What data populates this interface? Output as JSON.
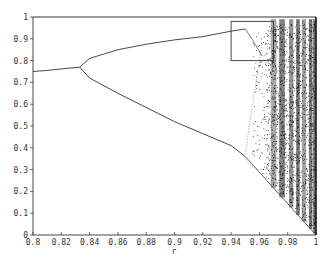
{
  "chart_data": {
    "type": "scatter",
    "title": "",
    "xlabel": "r",
    "ylabel": "",
    "xlim": [
      0.8,
      1.0
    ],
    "ylim": [
      0,
      1
    ],
    "grid": false,
    "legend": null,
    "x_ticks": [
      "0.8",
      "0.82",
      "0.84",
      "0.86",
      "0.88",
      "0.9",
      "0.92",
      "0.94",
      "0.96",
      "0.98",
      "1"
    ],
    "y_ticks": [
      "0",
      "0.1",
      "0.2",
      "0.3",
      "0.4",
      "0.5",
      "0.6",
      "0.7",
      "0.8",
      "0.9",
      "1"
    ],
    "series": [
      {
        "name": "fixed-point",
        "x": [
          0.8,
          0.81,
          0.82,
          0.833
        ],
        "y": [
          0.75,
          0.755,
          0.762,
          0.77
        ]
      },
      {
        "name": "upper-branch",
        "x": [
          0.833,
          0.84,
          0.86,
          0.88,
          0.9,
          0.92,
          0.94,
          0.95
        ],
        "y": [
          0.77,
          0.81,
          0.85,
          0.875,
          0.895,
          0.91,
          0.935,
          0.945
        ]
      },
      {
        "name": "lower-branch",
        "x": [
          0.833,
          0.84,
          0.86,
          0.88,
          0.9,
          0.92,
          0.94,
          0.95
        ],
        "y": [
          0.77,
          0.72,
          0.65,
          0.585,
          0.52,
          0.465,
          0.41,
          0.36
        ]
      },
      {
        "name": "top-line",
        "x": [
          0.8,
          1.0
        ],
        "y": [
          1.0,
          1.0
        ]
      }
    ],
    "annotations": [
      {
        "type": "rectangle",
        "x0": 0.94,
        "x1": 0.97,
        "y0": 0.8,
        "y1": 0.98,
        "label": "zoom region"
      }
    ],
    "chaotic_region": {
      "r_start": 0.96,
      "r_end": 1.0
    }
  }
}
